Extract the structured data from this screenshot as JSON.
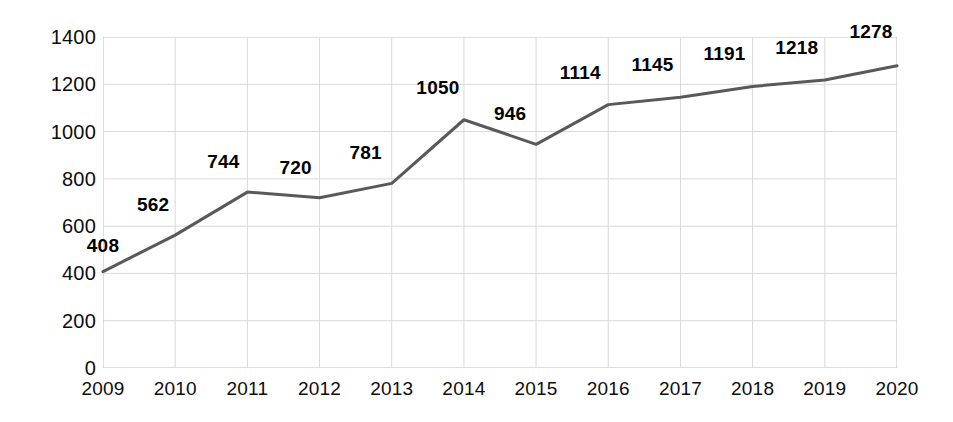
{
  "chart_data": {
    "type": "line",
    "title": "",
    "subtitle": "",
    "xlabel": "",
    "ylabel": "",
    "categories": [
      "2009",
      "2010",
      "2011",
      "2012",
      "2013",
      "2014",
      "2015",
      "2016",
      "2017",
      "2018",
      "2019",
      "2020"
    ],
    "values": [
      408,
      562,
      744,
      720,
      781,
      1050,
      946,
      1114,
      1145,
      1191,
      1218,
      1278
    ],
    "point_labels": [
      "408",
      "562",
      "744",
      "720",
      "781",
      "1050",
      "946",
      "1114",
      "1145",
      "1191",
      "1218",
      "1278"
    ],
    "series": [
      {
        "name": "",
        "values": [
          408,
          562,
          744,
          720,
          781,
          1050,
          946,
          1114,
          1145,
          1191,
          1218,
          1278
        ]
      }
    ],
    "ylim": [
      0,
      1400
    ],
    "y_ticks": [
      1400,
      1200,
      1000,
      800,
      600,
      400,
      200,
      0
    ],
    "y_tick_labels": [
      "1400",
      "1200",
      "1000",
      "800",
      "600",
      "400",
      "200",
      "0"
    ],
    "x_tick_labels": [
      "2009",
      "2010",
      "2011",
      "2012",
      "2013",
      "2014",
      "2015",
      "2016",
      "2017",
      "2018",
      "2019",
      "2020"
    ],
    "grid": true,
    "legend": null,
    "legend_position": "none",
    "colors": {
      "line": "#595959",
      "grid": "#d9d9d9",
      "axis": "#bfbfbf",
      "text": "#0d0d0d",
      "label": "#000000",
      "background": "#ffffff"
    },
    "line_width": 3,
    "markers": false
  }
}
